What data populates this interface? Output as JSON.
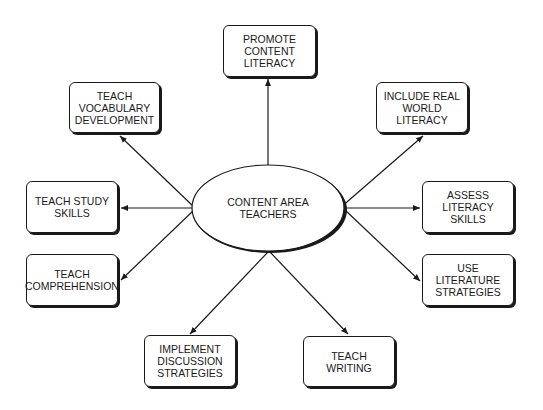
{
  "diagram": {
    "type": "hub-and-spoke concept map",
    "center": {
      "label": "CONTENT AREA\nTEACHERS",
      "shape": "ellipse"
    },
    "nodes": [
      {
        "id": "promote",
        "label": "PROMOTE\nCONTENT\nLITERACY"
      },
      {
        "id": "vocab",
        "label": "TEACH\nVOCABULARY\nDEVELOPMENT"
      },
      {
        "id": "realworld",
        "label": "INCLUDE REAL\nWORLD\nLITERACY"
      },
      {
        "id": "study",
        "label": "TEACH STUDY\nSKILLS"
      },
      {
        "id": "assess",
        "label": "ASSESS\nLITERACY\nSKILLS"
      },
      {
        "id": "comprehension",
        "label": "TEACH\nCOMPREHENSION"
      },
      {
        "id": "literature",
        "label": "USE\nLITERATURE\nSTRATEGIES"
      },
      {
        "id": "discussion",
        "label": "IMPLEMENT\nDISCUSSION\nSTRATEGIES"
      },
      {
        "id": "writing",
        "label": "TEACH\nWRITING"
      }
    ],
    "edges": [
      {
        "from": "center",
        "to": "promote"
      },
      {
        "from": "center",
        "to": "vocab"
      },
      {
        "from": "center",
        "to": "realworld"
      },
      {
        "from": "center",
        "to": "study"
      },
      {
        "from": "center",
        "to": "assess"
      },
      {
        "from": "center",
        "to": "comprehension"
      },
      {
        "from": "center",
        "to": "literature"
      },
      {
        "from": "center",
        "to": "discussion"
      },
      {
        "from": "center",
        "to": "writing"
      }
    ],
    "colors": {
      "stroke": "#1a1a1a",
      "fill": "#ffffff",
      "background": "#ffffff"
    }
  }
}
